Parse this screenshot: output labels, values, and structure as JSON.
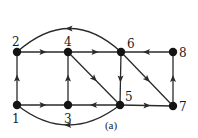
{
  "figure": {
    "caption": "(a)",
    "caption_pos": [
      111,
      129
    ],
    "edge_color": "#2a2a2a",
    "node_color": "#141414"
  },
  "nodes": [
    {
      "id": "1",
      "label": "1",
      "x": 17,
      "y": 105,
      "lx": 12,
      "ly": 123
    },
    {
      "id": "2",
      "label": "2",
      "x": 17,
      "y": 52,
      "lx": 12,
      "ly": 46
    },
    {
      "id": "3",
      "label": "3",
      "x": 68,
      "y": 105,
      "lx": 64,
      "ly": 123
    },
    {
      "id": "4",
      "label": "4",
      "x": 68,
      "y": 52,
      "lx": 64,
      "ly": 46
    },
    {
      "id": "5",
      "label": "5",
      "x": 120,
      "y": 105,
      "lx": 125,
      "ly": 101
    },
    {
      "id": "6",
      "label": "6",
      "x": 121,
      "y": 52,
      "lx": 127,
      "ly": 48
    },
    {
      "id": "7",
      "label": "7",
      "x": 173,
      "y": 106,
      "lx": 179,
      "ly": 111
    },
    {
      "id": "8",
      "label": "8",
      "x": 173,
      "y": 52,
      "lx": 179,
      "ly": 57
    }
  ],
  "edges": [
    {
      "from": "1",
      "to": "2",
      "type": "straight"
    },
    {
      "from": "2",
      "to": "4",
      "type": "straight"
    },
    {
      "from": "4",
      "to": "6",
      "type": "straight"
    },
    {
      "from": "6",
      "to": "2",
      "type": "arc",
      "ctrl": [
        70,
        5
      ]
    },
    {
      "from": "3",
      "to": "4",
      "type": "straight"
    },
    {
      "from": "4",
      "to": "5",
      "type": "straight"
    },
    {
      "from": "6",
      "to": "5",
      "type": "straight"
    },
    {
      "from": "6",
      "to": "7",
      "type": "straight"
    },
    {
      "from": "8",
      "to": "6",
      "type": "straight"
    },
    {
      "from": "7",
      "to": "8",
      "type": "straight"
    },
    {
      "from": "1",
      "to": "3",
      "type": "straight"
    },
    {
      "from": "5",
      "to": "3",
      "type": "straight"
    },
    {
      "from": "5",
      "to": "7",
      "type": "straight"
    },
    {
      "from": "5",
      "to": "1",
      "type": "arc",
      "ctrl": [
        68,
        145
      ]
    }
  ]
}
